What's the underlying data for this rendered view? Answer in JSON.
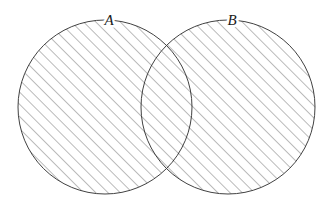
{
  "figure": {
    "kind": "venn-diagram",
    "title": "",
    "background_color": "#ffffff",
    "width": 335,
    "height": 220
  },
  "style": {
    "outline_color": "#2b2b2b",
    "outline_width": 0.9,
    "hatch_color": "#4a4a4a",
    "hatch_width": 0.75,
    "hatch_spacing": 6.1,
    "hatch_angle_deg": 45,
    "fill_color": "#ffffff",
    "label_color": "#1a1a1a"
  },
  "sets": [
    {
      "id": "A",
      "label": "A",
      "label_x": 109,
      "label_y": 22,
      "cx": 105,
      "cy": 107,
      "r": 87,
      "shaded": true
    },
    {
      "id": "B",
      "label": "B",
      "label_x": 232,
      "label_y": 22,
      "cx": 228,
      "cy": 107,
      "r": 87,
      "shaded": true
    }
  ],
  "regions": {
    "a_only": {
      "name": "A only",
      "shaded": true
    },
    "b_only": {
      "name": "B only",
      "shaded": true
    },
    "intersection": {
      "name": "A and B",
      "shaded": true
    },
    "outside": {
      "name": "outside",
      "shaded": false
    }
  },
  "caption": ""
}
